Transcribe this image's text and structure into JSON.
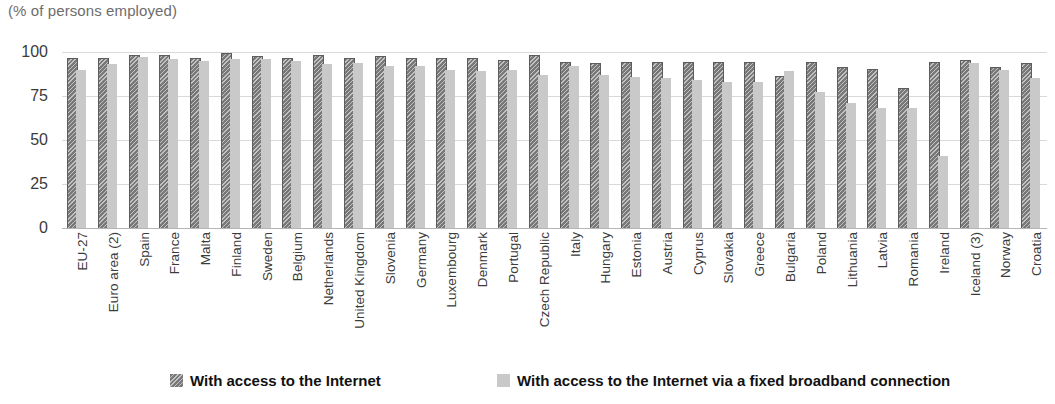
{
  "subtitle": "(% of persons employed)",
  "legend": {
    "items": [
      {
        "label": "With access to the Internet",
        "swatch": "dark-hatched-swatch",
        "color": "#787878"
      },
      {
        "label": "With access to the Internet via a fixed broadband connection",
        "swatch": "light-gray-swatch",
        "color": "#c9c9c9"
      }
    ]
  },
  "chart_data": {
    "type": "bar",
    "title": "",
    "subtitle": "(% of persons employed)",
    "xlabel": "",
    "ylabel": "",
    "ylim": [
      0,
      100
    ],
    "yticks": [
      0,
      25,
      50,
      75,
      100
    ],
    "grid": true,
    "legend_position": "bottom",
    "categories": [
      "EU-27",
      "Euro area (2)",
      "Spain",
      "France",
      "Malta",
      "Finland",
      "Sweden",
      "Belgium",
      "Netherlands",
      "United Kingdom",
      "Slovenia",
      "Germany",
      "Luxembourg",
      "Denmark",
      "Portugal",
      "Czech Republic",
      "Italy",
      "Hungary",
      "Estonia",
      "Austria",
      "Cyprus",
      "Slovakia",
      "Greece",
      "Bulgaria",
      "Poland",
      "Lithuania",
      "Latvia",
      "Romania",
      "Ireland",
      "Iceland (3)",
      "Norway",
      "Croatia"
    ],
    "series": [
      {
        "name": "With access to the Internet",
        "color": "#787878",
        "values": [
          96,
          96,
          98,
          98,
          96,
          99,
          97,
          96,
          98,
          96,
          97,
          96,
          96,
          96,
          95,
          98,
          94,
          93,
          94,
          94,
          94,
          94,
          94,
          86,
          94,
          91,
          90,
          79,
          94,
          95,
          91,
          93
        ]
      },
      {
        "name": "With access to the Internet via a fixed broadband connection",
        "color": "#c9c9c9",
        "values": [
          90,
          93,
          97,
          96,
          95,
          96,
          96,
          95,
          93,
          94,
          92,
          92,
          90,
          89,
          90,
          87,
          92,
          87,
          86,
          85,
          84,
          83,
          83,
          89,
          77,
          71,
          68,
          68,
          41,
          94,
          90,
          85
        ]
      }
    ]
  }
}
